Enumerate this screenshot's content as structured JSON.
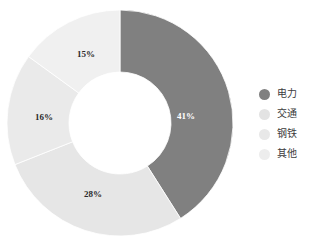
{
  "chart_data": {
    "type": "pie",
    "variant": "donut",
    "title": "",
    "subtitle": "",
    "xlabel": "",
    "ylabel": "",
    "grid": false,
    "legend_position": "right",
    "start_angle_deg": 0,
    "direction": "clockwise",
    "inner_radius_ratio": 0.45,
    "categories": [
      "电力",
      "交通",
      "钢铁",
      "其他"
    ],
    "values": [
      41,
      28,
      16,
      15
    ],
    "value_unit": "%",
    "data_labels": [
      "41%",
      "28%",
      "16%",
      "15%"
    ],
    "colors": [
      "#808080",
      "#e6e6e6",
      "#eaeaea",
      "#f0f0f0"
    ],
    "label_text_colors": [
      "#ffffff",
      "#2b2b2b",
      "#2b2b2b",
      "#2b2b2b"
    ],
    "slices": [
      {
        "name": "电力",
        "value": 41,
        "label": "41%",
        "color": "#808080",
        "label_color": "#ffffff",
        "label_x": 186,
        "label_y": 116
      },
      {
        "name": "交通",
        "value": 28,
        "label": "28%",
        "color": "#e6e6e6",
        "label_color": "#2b2b2b",
        "label_x": 93,
        "label_y": 194
      },
      {
        "name": "钢铁",
        "value": 16,
        "label": "16%",
        "color": "#eaeaea",
        "label_color": "#2b2b2b",
        "label_x": 44,
        "label_y": 117
      },
      {
        "name": "其他",
        "value": 15,
        "label": "15%",
        "color": "#f0f0f0",
        "label_color": "#2b2b2b",
        "label_x": 86,
        "label_y": 54
      }
    ]
  },
  "legend": {
    "items": [
      {
        "label": "电力",
        "color": "#808080"
      },
      {
        "label": "交通",
        "color": "#e3e3e3"
      },
      {
        "label": "钢铁",
        "color": "#e8e8e8"
      },
      {
        "label": "其他",
        "color": "#ededed"
      }
    ]
  },
  "geometry": {
    "center_x": 120,
    "center_y": 123,
    "outer_radius": 113,
    "inner_radius": 51
  }
}
